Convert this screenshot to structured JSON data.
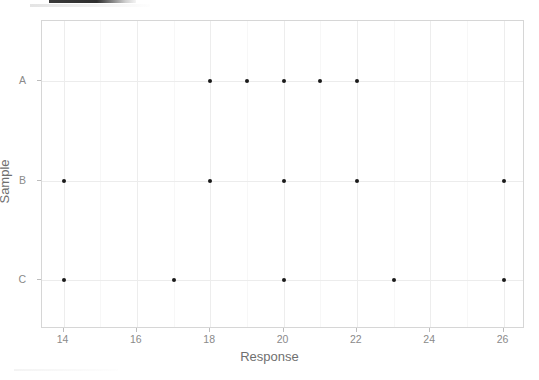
{
  "chart_data": {
    "type": "scatter",
    "title": "",
    "xlabel": "Response",
    "ylabel": "Sample",
    "xlim": [
      13.4,
      26.6
    ],
    "ylim_categories": [
      "C",
      "B",
      "A"
    ],
    "grid": true,
    "legend": "none",
    "x_ticks": [
      14,
      16,
      18,
      20,
      22,
      24,
      26
    ],
    "x_tick_labels": [
      "14",
      "16",
      "18",
      "20",
      "22",
      "24",
      "26"
    ],
    "x_minor_ticks": [
      15,
      17,
      19,
      21,
      23,
      25
    ],
    "y_ticks": [
      "A",
      "B",
      "C"
    ],
    "y_tick_labels": [
      "A",
      "B",
      "C"
    ],
    "point_color": "#1a1a1a",
    "panel_border_color": "#d6d6d6",
    "grid_color": "#ededed",
    "series": [
      {
        "name": "A",
        "category": "A",
        "values": [
          18,
          19,
          20,
          21,
          22
        ]
      },
      {
        "name": "B",
        "category": "B",
        "values": [
          14,
          18,
          20,
          22,
          26
        ]
      },
      {
        "name": "C",
        "category": "C",
        "values": [
          14,
          17,
          20,
          23,
          26
        ]
      }
    ],
    "points": [
      {
        "x": 18,
        "y": "A"
      },
      {
        "x": 19,
        "y": "A"
      },
      {
        "x": 20,
        "y": "A"
      },
      {
        "x": 21,
        "y": "A"
      },
      {
        "x": 22,
        "y": "A"
      },
      {
        "x": 14,
        "y": "B"
      },
      {
        "x": 18,
        "y": "B"
      },
      {
        "x": 20,
        "y": "B"
      },
      {
        "x": 22,
        "y": "B"
      },
      {
        "x": 26,
        "y": "B"
      },
      {
        "x": 14,
        "y": "C"
      },
      {
        "x": 17,
        "y": "C"
      },
      {
        "x": 20,
        "y": "C"
      },
      {
        "x": 23,
        "y": "C"
      },
      {
        "x": 26,
        "y": "C"
      }
    ]
  }
}
